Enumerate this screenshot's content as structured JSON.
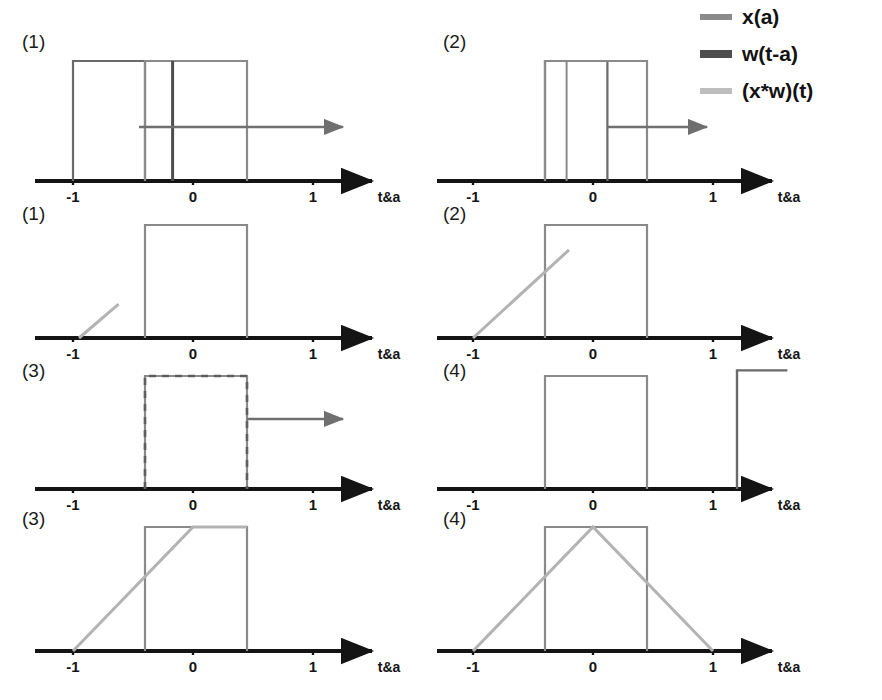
{
  "figure": {
    "axis_label": "t&a",
    "tick_labels": [
      "-1",
      "0",
      "1"
    ],
    "tick_values": [
      -1,
      0,
      1
    ]
  },
  "colors": {
    "axis": "#141414",
    "x_of_a": "#8a8a8a",
    "w_of_t_minus_a": "#555555",
    "x_conv_w": "#b3b3b3",
    "background": "#ffffff"
  },
  "legend": {
    "position": "top-right",
    "items": [
      {
        "label": "x(a)",
        "color": "#8a8a8a",
        "swatch": "line-swatch",
        "width": 6
      },
      {
        "label": "w(t-a)",
        "color": "#4d4d4d",
        "swatch": "line-swatch",
        "width": 8
      },
      {
        "label": "(x*w)(t)",
        "color": "#bdbdbd",
        "swatch": "line-swatch",
        "width": 6
      }
    ]
  },
  "panels": [
    {
      "id": "r1c1",
      "label": "(1)",
      "row": 1,
      "column": 1,
      "description": "w(t-a) pulse positioned left of x(a); no overlap product yet, sliding right",
      "arrow": {
        "from": -0.45,
        "to": 1.25,
        "y_frac": 0.45,
        "color": "#6f6f6f"
      },
      "shapes": [
        {
          "name": "w-pulse",
          "signal": "w(t-a)",
          "type": "rect",
          "x0": -1.0,
          "x1": -0.4,
          "height": 1.0,
          "color": "#6a6a6a",
          "width": 2.2
        },
        {
          "name": "x-pulse",
          "signal": "x(a)",
          "type": "rect",
          "x0": -0.4,
          "x1": 0.45,
          "height": 1.0,
          "color": "#8a8a8a",
          "width": 2.2
        },
        {
          "name": "w-right-edge",
          "signal": "w(t-a)",
          "type": "vline",
          "x": -0.17,
          "height": 1.0,
          "color": "#4d4d4d",
          "width": 3.0
        }
      ]
    },
    {
      "id": "r1c2",
      "label": "(2)",
      "row": 1,
      "column": 2,
      "description": "w(t-a) has slid right, partially overlapping x(a)",
      "arrow": {
        "from": 0.12,
        "to": 0.95,
        "y_frac": 0.45,
        "color": "#6f6f6f"
      },
      "shapes": [
        {
          "name": "w-pulse",
          "signal": "w(t-a)",
          "type": "rect",
          "x0": -0.4,
          "x1": 0.12,
          "height": 1.0,
          "color": "#6a6a6a",
          "width": 2.2
        },
        {
          "name": "x-pulse",
          "signal": "x(a)",
          "type": "rect",
          "x0": -0.4,
          "x1": 0.45,
          "height": 1.0,
          "color": "#8a8a8a",
          "width": 2.2
        },
        {
          "name": "w-inner-edge",
          "signal": "w(t-a)",
          "type": "vline",
          "x": -0.22,
          "height": 1.0,
          "color": "#8a8a8a",
          "width": 2.0
        }
      ]
    },
    {
      "id": "r2c1",
      "label": "(1)",
      "row": 2,
      "column": 1,
      "description": "Convolution output just starting to rise near t = -0.8",
      "arrow": null,
      "shapes": [
        {
          "name": "x-pulse",
          "signal": "x(a)",
          "type": "rect",
          "x0": -0.4,
          "x1": 0.45,
          "height": 1.0,
          "color": "#8a8a8a",
          "width": 2.2
        },
        {
          "name": "conv-ramp",
          "signal": "(x*w)(t)",
          "type": "polyline",
          "points": [
            [
              -0.95,
              0.0
            ],
            [
              -0.62,
              0.3
            ]
          ],
          "color": "#b3b3b3",
          "width": 3.0
        }
      ]
    },
    {
      "id": "r2c2",
      "label": "(2)",
      "row": 2,
      "column": 2,
      "description": "Convolution output rising linearly toward the overlap plateau",
      "arrow": null,
      "shapes": [
        {
          "name": "x-pulse",
          "signal": "x(a)",
          "type": "rect",
          "x0": -0.4,
          "x1": 0.45,
          "height": 1.0,
          "color": "#8a8a8a",
          "width": 2.2
        },
        {
          "name": "conv-ramp",
          "signal": "(x*w)(t)",
          "type": "polyline",
          "points": [
            [
              -1.0,
              0.0
            ],
            [
              -0.2,
              0.78
            ]
          ],
          "color": "#b3b3b3",
          "width": 3.0
        }
      ]
    },
    {
      "id": "r3c1",
      "label": "(3)",
      "row": 3,
      "column": 1,
      "description": "w(t-a) exactly aligned with x(a) (maximum overlap), shown as dashed overlay",
      "arrow": {
        "from": 0.45,
        "to": 1.25,
        "y_frac": 0.62,
        "color": "#6f6f6f"
      },
      "shapes": [
        {
          "name": "x-pulse",
          "signal": "x(a)",
          "type": "rect",
          "x0": -0.4,
          "x1": 0.45,
          "height": 1.0,
          "color": "#8a8a8a",
          "width": 2.2
        },
        {
          "name": "w-pulse-dashed",
          "signal": "w(t-a)",
          "type": "rect-dashed",
          "x0": -0.4,
          "x1": 0.45,
          "height": 1.0,
          "color": "#5f5f5f",
          "width": 2.6,
          "dash": "7,6"
        }
      ]
    },
    {
      "id": "r3c2",
      "label": "(4)",
      "row": 3,
      "column": 2,
      "description": "w(t-a) has slid past x(a); overlap ended, leading edge at t = 1.2",
      "arrow": null,
      "shapes": [
        {
          "name": "x-pulse",
          "signal": "x(a)",
          "type": "rect",
          "x0": -0.4,
          "x1": 0.45,
          "height": 1.0,
          "color": "#8a8a8a",
          "width": 2.2
        },
        {
          "name": "w-pulse-edge",
          "signal": "w(t-a)",
          "type": "polyline",
          "points": [
            [
              1.2,
              0.0
            ],
            [
              1.2,
              1.05
            ],
            [
              1.62,
              1.05
            ]
          ],
          "color": "#6a6a6a",
          "width": 2.4
        }
      ]
    },
    {
      "id": "r4c1",
      "label": "(3)",
      "row": 4,
      "column": 1,
      "description": "Convolution output reached its peak at t = 0",
      "arrow": null,
      "shapes": [
        {
          "name": "x-pulse",
          "signal": "x(a)",
          "type": "rect",
          "x0": -0.4,
          "x1": 0.45,
          "height": 1.0,
          "color": "#8a8a8a",
          "width": 2.2
        },
        {
          "name": "conv-ramp",
          "signal": "(x*w)(t)",
          "type": "polyline",
          "points": [
            [
              -1.0,
              0.0
            ],
            [
              0.0,
              1.0
            ],
            [
              0.45,
              1.0
            ]
          ],
          "color": "#b3b3b3",
          "width": 3.0
        }
      ]
    },
    {
      "id": "r4c2",
      "label": "(4)",
      "row": 4,
      "column": 2,
      "description": "Complete triangular convolution result spanning t = -1 to t = 1 with peak 1 at t = 0",
      "arrow": null,
      "shapes": [
        {
          "name": "x-pulse",
          "signal": "x(a)",
          "type": "rect",
          "x0": -0.4,
          "x1": 0.45,
          "height": 1.0,
          "color": "#8a8a8a",
          "width": 2.2
        },
        {
          "name": "conv-triangle",
          "signal": "(x*w)(t)",
          "type": "polyline",
          "points": [
            [
              -1.0,
              0.0
            ],
            [
              0.0,
              1.0
            ],
            [
              1.0,
              0.0
            ]
          ],
          "color": "#b3b3b3",
          "width": 3.0
        }
      ]
    }
  ],
  "chart_data": {
    "type": "line",
    "xlabel": "t&a",
    "ylabel": "",
    "xlim": [
      -1.35,
      1.65
    ],
    "ylim": [
      0,
      1.2
    ],
    "grid": false,
    "legend_position": "top-right",
    "xticks": [
      -1,
      0,
      1
    ],
    "xticklabels": [
      "-1",
      "0",
      "1"
    ],
    "series": [
      {
        "name": "x(a)",
        "color": "#8a8a8a",
        "kind": "rect-pulse",
        "support": [
          -0.4,
          0.45
        ],
        "amplitude": 1.0
      },
      {
        "name": "w(t-a)",
        "color": "#4d4d4d",
        "kind": "rect-pulse-sliding",
        "width": 0.85,
        "amplitude": 1.0,
        "positions": [
          -0.7,
          -0.14,
          0.025,
          1.62
        ]
      },
      {
        "name": "(x*w)(t)",
        "color": "#b3b3b3",
        "kind": "triangle",
        "support": [
          -1.0,
          1.0
        ],
        "peak_x": 0.0,
        "peak_y": 1.0,
        "partials": [
          {
            "panel": "r2c1",
            "points": [
              [
                -0.95,
                0.0
              ],
              [
                -0.62,
                0.3
              ]
            ]
          },
          {
            "panel": "r2c2",
            "points": [
              [
                -1.0,
                0.0
              ],
              [
                -0.2,
                0.78
              ]
            ]
          },
          {
            "panel": "r4c1",
            "points": [
              [
                -1.0,
                0.0
              ],
              [
                0.0,
                1.0
              ],
              [
                0.45,
                1.0
              ]
            ]
          },
          {
            "panel": "r4c2",
            "points": [
              [
                -1.0,
                0.0
              ],
              [
                0.0,
                1.0
              ],
              [
                1.0,
                0.0
              ]
            ]
          }
        ]
      }
    ]
  }
}
